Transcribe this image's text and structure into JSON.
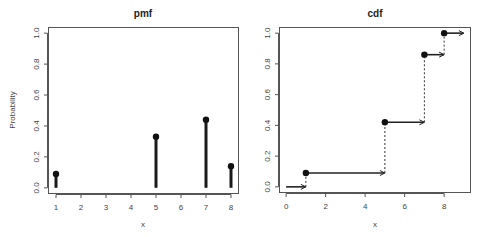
{
  "chart_data": [
    {
      "type": "bar",
      "subtype": "stem",
      "title": "pmf",
      "xlabel": "x",
      "ylabel": "Probability",
      "x": [
        1,
        5,
        7,
        8
      ],
      "values": [
        0.09,
        0.33,
        0.44,
        0.14
      ],
      "xticks": [
        1,
        2,
        3,
        4,
        5,
        6,
        7,
        8
      ],
      "xtick_labels": [
        "1",
        "2",
        "3",
        "4",
        "5",
        "6",
        "7",
        "8"
      ],
      "yticks": [
        0.0,
        0.2,
        0.4,
        0.6,
        0.8,
        1.0
      ],
      "ytick_labels": [
        "0.0",
        "0.2",
        "0.4",
        "0.6",
        "0.8",
        "1.0"
      ],
      "xlim": [
        0.68,
        8.32
      ],
      "ylim": [
        -0.04,
        1.04
      ],
      "grid": false,
      "legend": null
    },
    {
      "type": "line",
      "subtype": "step",
      "title": "cdf",
      "xlabel": "x",
      "ylabel": "",
      "steps": [
        {
          "x_start": 0,
          "x_end": 1,
          "y": 0.0,
          "closed_dot": false
        },
        {
          "x_start": 1,
          "x_end": 5,
          "y": 0.09,
          "closed_dot": true
        },
        {
          "x_start": 5,
          "x_end": 7,
          "y": 0.42,
          "closed_dot": true
        },
        {
          "x_start": 7,
          "x_end": 8,
          "y": 0.86,
          "closed_dot": true
        },
        {
          "x_start": 8,
          "x_end": 9,
          "y": 1.0,
          "closed_dot": true
        }
      ],
      "x": [
        1,
        5,
        7,
        8
      ],
      "values": [
        0.09,
        0.42,
        0.86,
        1.0
      ],
      "xticks": [
        0,
        2,
        4,
        6,
        8
      ],
      "xtick_labels": [
        "0",
        "2",
        "4",
        "6",
        "8"
      ],
      "yticks": [
        0.0,
        0.2,
        0.4,
        0.6,
        0.8,
        1.0
      ],
      "ytick_labels": [
        "0.0",
        "0.2",
        "0.4",
        "0.6",
        "0.8",
        "1.0"
      ],
      "xlim": [
        -0.36,
        9.36
      ],
      "ylim": [
        -0.04,
        1.04
      ],
      "grid": false,
      "legend": null
    }
  ],
  "panels": {
    "pmf": {
      "title": "pmf",
      "xlabel": "x",
      "ylabel": "Probability"
    },
    "cdf": {
      "title": "cdf",
      "xlabel": "x",
      "ylabel": ""
    }
  },
  "colors": {
    "ink": "#111111",
    "axis": "#555555",
    "text": "#444444",
    "background": "#ffffff"
  }
}
